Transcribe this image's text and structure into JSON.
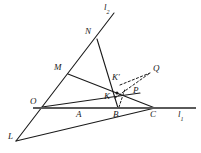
{
  "figure": {
    "stroke_color": "#1a1a1a",
    "baseline_color": "#5a5a5a",
    "background": "#ffffff"
  },
  "lines": {
    "l1": {
      "name": "l1",
      "label": "l",
      "subscript": "1",
      "description": "horizontal baseline through O, A, B, C",
      "x1": 33,
      "y1": 108,
      "x2": 196,
      "y2": 108
    },
    "l2": {
      "name": "l2",
      "label": "l",
      "subscript": "2",
      "description": "line through L, O, M, N rising to upper right",
      "x1": 16,
      "y1": 141,
      "x2": 114,
      "y2": 13
    }
  },
  "points": [
    {
      "id": "L",
      "label": "L",
      "prime": false,
      "x": 16,
      "y": 141,
      "label_x": 8,
      "label_y": 137
    },
    {
      "id": "O",
      "label": "O",
      "prime": false,
      "x": 42,
      "y": 107,
      "label_x": 30,
      "label_y": 102
    },
    {
      "id": "M",
      "label": "M",
      "prime": false,
      "x": 68,
      "y": 74,
      "label_x": 56,
      "label_y": 68
    },
    {
      "id": "N",
      "label": "N",
      "prime": false,
      "x": 97,
      "y": 39,
      "label_x": 86,
      "label_y": 32
    },
    {
      "id": "A",
      "label": "A",
      "prime": false,
      "x": 81,
      "y": 108,
      "label_x": 77,
      "label_y": 113
    },
    {
      "id": "B",
      "label": "B",
      "prime": false,
      "x": 118,
      "y": 108,
      "label_x": 114,
      "label_y": 113
    },
    {
      "id": "C",
      "label": "C",
      "prime": false,
      "x": 155,
      "y": 108,
      "label_x": 151,
      "label_y": 113
    },
    {
      "id": "K",
      "label": "K",
      "prime": false,
      "x": 114,
      "y": 97,
      "label_x": 106,
      "label_y": 96
    },
    {
      "id": "Kp",
      "label": "K",
      "prime": true,
      "x": 120,
      "y": 85,
      "label_x": 113,
      "label_y": 77
    },
    {
      "id": "P",
      "label": "P",
      "prime": false,
      "x": 137,
      "y": 94,
      "label_x": 134,
      "label_y": 90
    },
    {
      "id": "Q",
      "label": "Q",
      "prime": false,
      "x": 151,
      "y": 75,
      "label_x": 154,
      "label_y": 69
    }
  ],
  "segments": [
    {
      "id": "l1-baseline",
      "name": "line-l1",
      "from": [
        33,
        108
      ],
      "to": [
        196,
        108
      ],
      "style": "solid",
      "weight": "thick"
    },
    {
      "id": "l2-main",
      "name": "line-l2",
      "from": [
        16,
        141
      ],
      "to": [
        114,
        13
      ],
      "style": "solid",
      "weight": "normal"
    },
    {
      "id": "L-C",
      "name": "segment-L-C",
      "from": [
        16,
        141
      ],
      "to": [
        155,
        108
      ],
      "style": "solid",
      "weight": "normal"
    },
    {
      "id": "N-B",
      "name": "segment-N-B",
      "from": [
        97,
        39
      ],
      "to": [
        118,
        108
      ],
      "style": "solid",
      "weight": "normal"
    },
    {
      "id": "M-C",
      "name": "segment-M-C",
      "from": [
        68,
        74
      ],
      "to": [
        155,
        108
      ],
      "style": "solid",
      "weight": "normal"
    },
    {
      "id": "O-A-ext",
      "name": "segment-O-through-K",
      "from": [
        42,
        107
      ],
      "to": [
        137,
        94
      ],
      "style": "solid",
      "weight": "normal"
    }
  ],
  "dashed_segments": [
    {
      "id": "Kp-Q",
      "name": "dashed-segment-Kprime-Q",
      "from": [
        120,
        85
      ],
      "to": [
        150,
        73
      ]
    },
    {
      "id": "K-Q",
      "name": "dashed-segment-K-Q",
      "from": [
        115,
        98
      ],
      "to": [
        150,
        73
      ]
    },
    {
      "id": "B-Kp",
      "name": "dashed-segment-B-Kprime",
      "from": [
        118,
        107
      ],
      "to": [
        125,
        90
      ]
    }
  ]
}
